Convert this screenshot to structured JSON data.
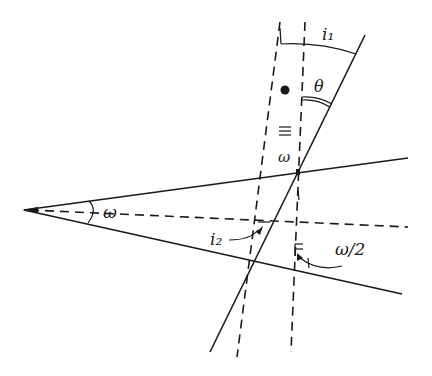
{
  "figure": {
    "labels": {
      "apex_angle": "ω",
      "incidence_angle": "i₁",
      "exit_angle": "i₂",
      "deviation_angle": "θ",
      "inner_angle": "ω",
      "half_angle": "ω/2"
    },
    "colors": {
      "ink": "#1a1a1a",
      "background": "#ffffff"
    }
  }
}
